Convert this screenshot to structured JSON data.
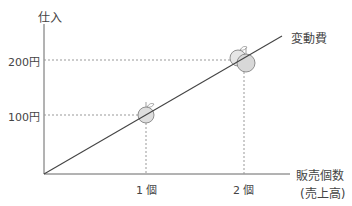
{
  "diagram": {
    "y_axis_label": "仕入",
    "x_axis_label": "販売個数",
    "x_axis_sublabel": "(売上高)",
    "line_label": "変動費",
    "y_ticks": [
      "200円",
      "100円"
    ],
    "x_ticks": [
      "1 個",
      "2 個"
    ],
    "icons": [
      "apple-icon",
      "apples-icon"
    ]
  }
}
